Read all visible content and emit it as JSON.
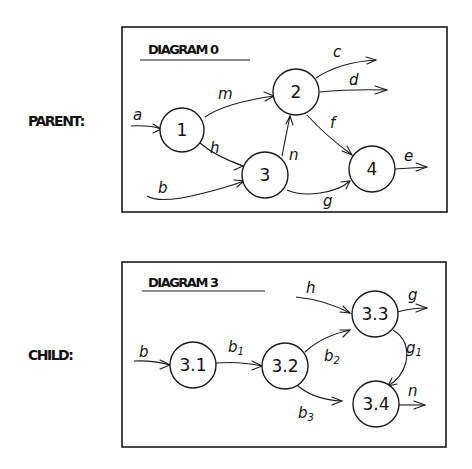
{
  "labels": {
    "parent_side": "PARENT:",
    "child_side": "CHILD:"
  },
  "parent_diagram": {
    "title": "DIAGRAM 0",
    "nodes": [
      {
        "id": "1",
        "label": "1"
      },
      {
        "id": "2",
        "label": "2"
      },
      {
        "id": "3",
        "label": "3"
      },
      {
        "id": "4",
        "label": "4"
      }
    ],
    "edges": [
      {
        "label": "a",
        "from": "external",
        "to": "1"
      },
      {
        "label": "b",
        "from": "external",
        "to": "3"
      },
      {
        "label": "m",
        "from": "1",
        "to": "2"
      },
      {
        "label": "h",
        "from": "1",
        "to": "3"
      },
      {
        "label": "n",
        "from": "3",
        "to": "2"
      },
      {
        "label": "c",
        "from": "2",
        "to": "external"
      },
      {
        "label": "d",
        "from": "2",
        "to": "external"
      },
      {
        "label": "f",
        "from": "2",
        "to": "4"
      },
      {
        "label": "g",
        "from": "3",
        "to": "4"
      },
      {
        "label": "e",
        "from": "4",
        "to": "external"
      }
    ]
  },
  "child_diagram": {
    "title": "DIAGRAM 3",
    "nodes": [
      {
        "id": "3.1",
        "label": "3.1"
      },
      {
        "id": "3.2",
        "label": "3.2"
      },
      {
        "id": "3.3",
        "label": "3.3"
      },
      {
        "id": "3.4",
        "label": "3.4"
      }
    ],
    "edges": [
      {
        "label": "b",
        "from": "external",
        "to": "3.1"
      },
      {
        "label": "b",
        "sub": "1",
        "from": "3.1",
        "to": "3.2"
      },
      {
        "label": "b",
        "sub": "2",
        "from": "3.2",
        "to": "3.3"
      },
      {
        "label": "b",
        "sub": "3",
        "from": "3.2",
        "to": "3.4"
      },
      {
        "label": "h",
        "from": "external",
        "to": "3.3"
      },
      {
        "label": "g",
        "from": "3.3",
        "to": "external"
      },
      {
        "label": "g",
        "sub": "1",
        "from": "3.3",
        "to": "3.4"
      },
      {
        "label": "n",
        "from": "3.4",
        "to": "external"
      }
    ]
  }
}
